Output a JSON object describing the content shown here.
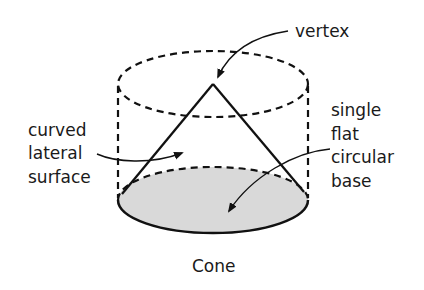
{
  "diagram": {
    "title": "Cone",
    "labels": {
      "vertex": "vertex",
      "lateral": [
        "curved",
        "lateral",
        "surface"
      ],
      "base": [
        "single",
        "flat",
        "circular",
        "base"
      ]
    },
    "colors": {
      "stroke": "#111111",
      "base_fill": "#d9d9d9",
      "background": "#ffffff"
    }
  }
}
